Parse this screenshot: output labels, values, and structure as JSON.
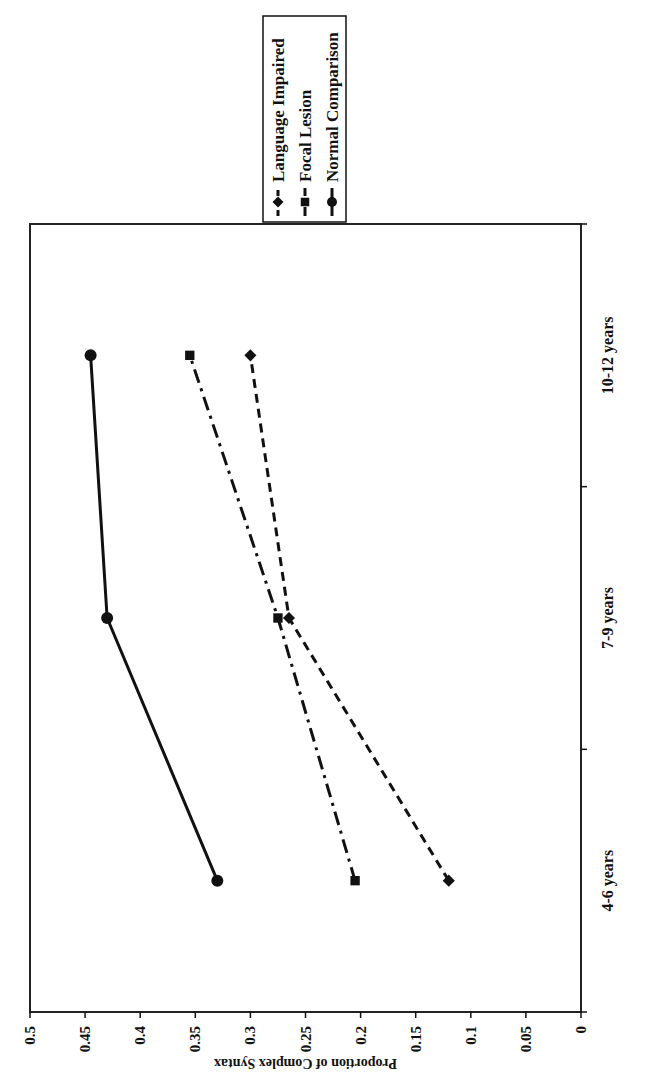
{
  "chart_data": {
    "type": "line",
    "title": "",
    "xlabel": "",
    "ylabel": "Proportion of Complex Syntax",
    "ylim": [
      0,
      0.5
    ],
    "yticks": [
      "0",
      "0.05",
      "0.1",
      "0.15",
      "0.2",
      "0.25",
      "0.3",
      "0.35",
      "0.4",
      "0.45",
      "0.5"
    ],
    "categories": [
      "4-6 years",
      "7-9 years",
      "10-12 years"
    ],
    "grid": false,
    "legend_position": "right",
    "orientation_note": "figure rotated 90 degrees counter-clockwise in scan",
    "series": [
      {
        "name": "Language Impaired",
        "marker": "diamond",
        "line_style": "dashed",
        "values": [
          0.12,
          0.265,
          0.3
        ]
      },
      {
        "name": "Focal Lesion",
        "marker": "square",
        "line_style": "dash-dot",
        "values": [
          0.205,
          0.275,
          0.355
        ]
      },
      {
        "name": "Normal Comparison",
        "marker": "circle",
        "line_style": "solid",
        "values": [
          0.33,
          0.43,
          0.445
        ]
      }
    ],
    "colors": {
      "line": "#111111",
      "background": "#ffffff",
      "frame": "#222222"
    }
  }
}
